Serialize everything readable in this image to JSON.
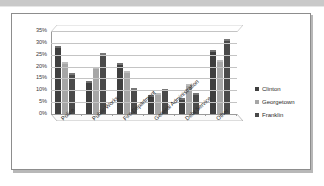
{
  "chart_data": {
    "type": "bar",
    "title": "",
    "subtitle": "",
    "xlabel": "",
    "ylabel": "",
    "categories": [
      "Police",
      "Public Works",
      "Fire Department",
      "General Administration",
      "Debt Service",
      "Other"
    ],
    "series": [
      {
        "name": "Clinton",
        "color": "#3f3f3f",
        "values": [
          28,
          13,
          20.5,
          7,
          6,
          26
        ]
      },
      {
        "name": "Georgetown",
        "color": "#a6a6a6",
        "values": [
          21,
          19,
          17.5,
          8,
          12,
          22
        ]
      },
      {
        "name": "Franklin",
        "color": "#4a4a4a",
        "values": [
          16.5,
          25,
          10,
          9.5,
          8,
          31
        ]
      }
    ],
    "ylim": [
      0,
      35
    ],
    "y_tick_step": 5,
    "y_tick_labels": [
      "35%",
      "30%",
      "25%",
      "20%",
      "15%",
      "10%",
      "5%",
      "0%"
    ],
    "grid": true,
    "legend_position": "right",
    "three_d": true,
    "value_suffix": "%"
  },
  "figure": {
    "border_color": "#8d8d8d",
    "background": "#ffffff",
    "plot_background": "#ffffff",
    "gridline_color": "#c4c4c4",
    "axis_color": "#9a9a9a"
  }
}
